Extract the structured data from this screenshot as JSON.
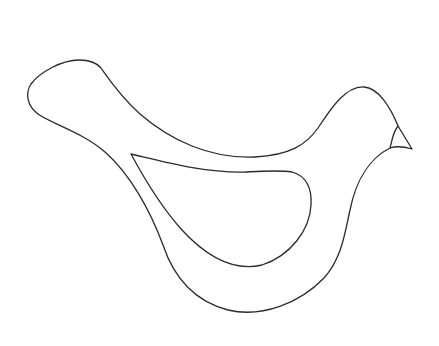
{
  "drawing": {
    "subject": "bird outline",
    "parts": [
      "body-outline",
      "wing-outline",
      "beak-outline"
    ],
    "stroke_color": "#2a2a2a",
    "background_color": "#ffffff"
  }
}
